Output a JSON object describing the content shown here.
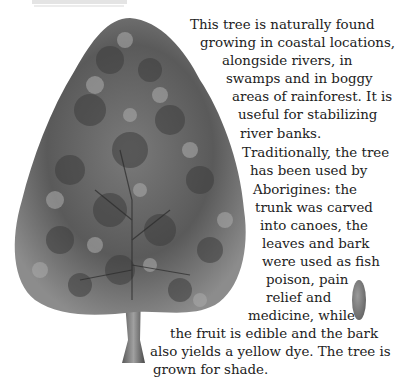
{
  "caption": {
    "note": ""
  },
  "illustration": {
    "subject": "tree-illustration",
    "colors": {
      "foliage_dark": "#3a3a3a",
      "foliage_mid": "#6e6e6e",
      "foliage_light": "#a8a8a8",
      "trunk": "#777777"
    }
  },
  "body_text": {
    "lines": [
      "This tree is naturally found",
      "growing in coastal locations,",
      "alongside rivers, in",
      "swamps and in boggy",
      "areas of rainforest. It is",
      "useful for stabilizing",
      "river banks.",
      "Traditionally, the tree",
      "has been used by",
      "Aborigines: the",
      "trunk was carved",
      "into canoes, the",
      "leaves and bark",
      "were used as fish",
      "poison, pain",
      "relief and",
      "medicine, while",
      "the fruit is edible and the bark",
      "also yields a yellow dye. The tree is",
      "grown for shade."
    ]
  }
}
